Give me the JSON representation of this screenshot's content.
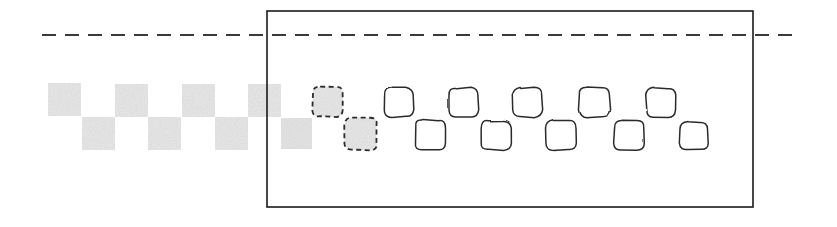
{
  "figure": {
    "title": "",
    "width": 837,
    "height": 227,
    "background_color": "#ffffff"
  },
  "colors": {
    "stroke_dark": "#1a1a1a",
    "stroke_shape": "#2b2b2b",
    "fill_noise": "#c9c9c9",
    "fill_noise_light": "#dcdcdc",
    "fill_white": "#ffffff",
    "dashed_line": "#3a3a3a"
  },
  "boundary_box": {
    "label": "crop-region-rectangle",
    "x": 267,
    "y": 11,
    "width": 486,
    "height": 196,
    "stroke_width": 1.6,
    "fill": "none"
  },
  "dashed_line": {
    "label": "horizon-dashed-line",
    "y": 35,
    "x_start": 42,
    "x_end": 800,
    "dash_pattern": "14 9",
    "stroke_width": 1.8
  },
  "shapes": {
    "noise_squares_outside": [
      {
        "x": 48,
        "y": 83,
        "w": 33,
        "h": 33,
        "row": "top"
      },
      {
        "x": 115,
        "y": 84,
        "w": 33,
        "h": 33,
        "row": "top"
      },
      {
        "x": 182,
        "y": 84,
        "w": 33,
        "h": 33,
        "row": "top"
      },
      {
        "x": 248,
        "y": 84,
        "w": 33,
        "h": 33,
        "row": "top"
      },
      {
        "x": 82,
        "y": 117,
        "w": 33,
        "h": 33,
        "row": "bottom"
      },
      {
        "x": 148,
        "y": 117,
        "w": 33,
        "h": 33,
        "row": "bottom"
      },
      {
        "x": 215,
        "y": 117,
        "w": 33,
        "h": 33,
        "row": "bottom"
      }
    ],
    "noise_squares_inside": [
      {
        "x": 281,
        "y": 118,
        "w": 31,
        "h": 31,
        "row": "bottom"
      }
    ],
    "dashed_noise_squares": [
      {
        "x": 313,
        "y": 86,
        "w": 30,
        "h": 31,
        "row": "top"
      },
      {
        "x": 345,
        "y": 118,
        "w": 32,
        "h": 32,
        "row": "bottom"
      }
    ],
    "outline_squares": [
      {
        "x": 384,
        "y": 88,
        "w": 29,
        "h": 29,
        "row": "top"
      },
      {
        "x": 449,
        "y": 88,
        "w": 29,
        "h": 29,
        "row": "top"
      },
      {
        "x": 513,
        "y": 88,
        "w": 29,
        "h": 29,
        "row": "top"
      },
      {
        "x": 579,
        "y": 87,
        "w": 31,
        "h": 30,
        "row": "top"
      },
      {
        "x": 646,
        "y": 88,
        "w": 29,
        "h": 29,
        "row": "top"
      },
      {
        "x": 415,
        "y": 120,
        "w": 30,
        "h": 30,
        "row": "bottom"
      },
      {
        "x": 481,
        "y": 120,
        "w": 30,
        "h": 30,
        "row": "bottom"
      },
      {
        "x": 546,
        "y": 120,
        "w": 30,
        "h": 30,
        "row": "bottom"
      },
      {
        "x": 614,
        "y": 120,
        "w": 30,
        "h": 30,
        "row": "bottom"
      },
      {
        "x": 680,
        "y": 122,
        "w": 28,
        "h": 28,
        "row": "bottom"
      }
    ]
  },
  "counts": {
    "noise_squares_outside": 7,
    "noise_squares_inside": 1,
    "dashed_noise_squares": 2,
    "outline_squares": 10,
    "total_squares": 20
  }
}
